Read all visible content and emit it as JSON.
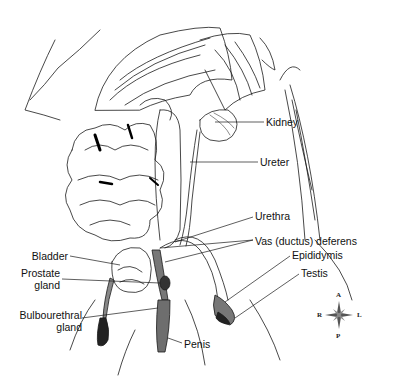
{
  "diagram": {
    "labels": {
      "kidney": "Kidney",
      "ureter": "Ureter",
      "urethra": "Urethra",
      "vas_deferens": "Vas (ductus) deferens",
      "epididymis": "Epididymis",
      "testis": "Testis",
      "bladder": "Bladder",
      "prostate_line1": "Prostate",
      "prostate_line2": "gland",
      "bulbourethral_line1": "Bulbourethral",
      "bulbourethral_line2": "gland",
      "penis": "Penis"
    },
    "compass": {
      "a": "A",
      "p": "P",
      "r": "R",
      "l": "L"
    },
    "colors": {
      "line": "#1a1a1a",
      "shade": "#6e6e6e",
      "dark": "#222222",
      "background": "#ffffff"
    }
  }
}
